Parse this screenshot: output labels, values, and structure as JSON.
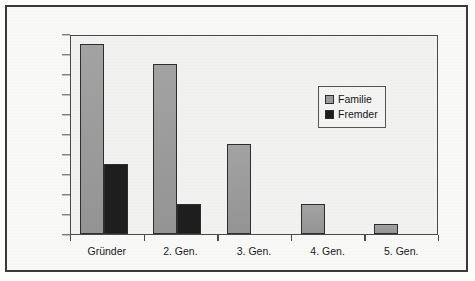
{
  "chart_data": {
    "type": "bar",
    "title": "",
    "xlabel": "",
    "ylabel": "Anzahl der Unternehmer",
    "categories": [
      "Gründer",
      "2. Gen.",
      "3. Gen.",
      "4. Gen.",
      "5. Gen."
    ],
    "series": [
      {
        "name": "Familie",
        "values": [
          19,
          17,
          9,
          3,
          1
        ],
        "color": "#9e9e9e"
      },
      {
        "name": "Fremder",
        "values": [
          7,
          3,
          0,
          0,
          0
        ],
        "color": "#1e1e1e"
      }
    ],
    "ylim": [
      0,
      20
    ],
    "ytick_step": 2,
    "yticks": [
      0,
      2,
      4,
      6,
      8,
      10,
      12,
      14,
      16,
      18,
      20
    ],
    "grid": false,
    "legend_position": "upper-right-inside",
    "legend_entries": [
      "Familie",
      "Fremder"
    ]
  },
  "axes": {
    "y_title": "Anzahl der Unternehmer"
  },
  "legend": {
    "items": [
      {
        "label": "Familie",
        "swatch": "gray-square-icon"
      },
      {
        "label": "Fremder",
        "swatch": "black-square-icon"
      }
    ]
  }
}
